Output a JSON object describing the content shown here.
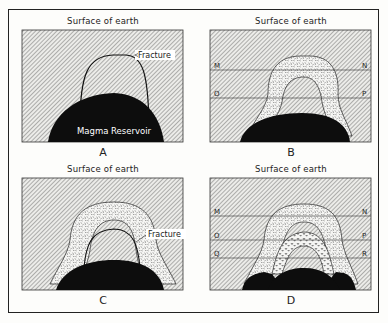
{
  "figure": {
    "panels": [
      {
        "id": "A",
        "letter": "A",
        "surface_label": "Surface of earth",
        "callout": "Fracture",
        "reservoir_label": "Magma Reservoir",
        "horizon_lines": []
      },
      {
        "id": "B",
        "letter": "B",
        "surface_label": "Surface of earth",
        "horizon_lines": [
          {
            "left": "M",
            "right": "N"
          },
          {
            "left": "O",
            "right": "P"
          }
        ]
      },
      {
        "id": "C",
        "letter": "C",
        "surface_label": "Surface of earth",
        "callout": "Fracture",
        "horizon_lines": []
      },
      {
        "id": "D",
        "letter": "D",
        "surface_label": "Surface of earth",
        "horizon_lines": [
          {
            "left": "M",
            "right": "N"
          },
          {
            "left": "O",
            "right": "P"
          },
          {
            "left": "Q",
            "right": "R"
          }
        ]
      }
    ],
    "colors": {
      "hatch": "#6a6a6a",
      "rock_bg": "#e9e9e6",
      "magma": "#0d0d0d",
      "intrusion_bg": "#f4f4f2",
      "line": "#222222"
    }
  }
}
